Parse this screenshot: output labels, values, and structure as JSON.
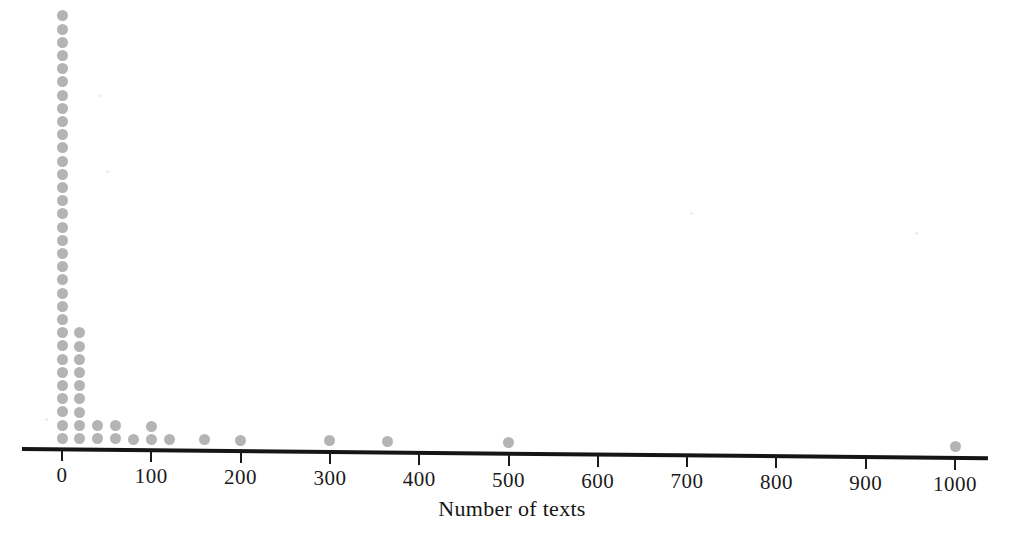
{
  "chart_data": {
    "type": "dotplot",
    "title": "",
    "xlabel": "Number of texts",
    "ylabel": "",
    "xlim": [
      -10,
      1040
    ],
    "xticks": [
      0,
      100,
      200,
      300,
      400,
      500,
      600,
      700,
      800,
      900,
      1000
    ],
    "xticklabels": [
      "0",
      "100",
      "200",
      "300",
      "400",
      "500",
      "600",
      "700",
      "800",
      "900",
      "1000"
    ],
    "grid": false,
    "legend": null,
    "dot_color": "#b4b4b4",
    "axis_color": "#151515",
    "dot_diameter_px": 11,
    "dot_stack_spacing_px": 13.2,
    "x_values": [
      0,
      20,
      40,
      60,
      80,
      100,
      120,
      160,
      200,
      300,
      365,
      500,
      1000
    ],
    "counts": [
      33,
      9,
      2,
      2,
      1,
      2,
      1,
      1,
      1,
      1,
      1,
      1,
      1
    ],
    "stacks": [
      {
        "value": 0,
        "count": 33
      },
      {
        "value": 20,
        "count": 9
      },
      {
        "value": 40,
        "count": 2
      },
      {
        "value": 60,
        "count": 2
      },
      {
        "value": 80,
        "count": 1
      },
      {
        "value": 100,
        "count": 2
      },
      {
        "value": 120,
        "count": 1
      },
      {
        "value": 160,
        "count": 1
      },
      {
        "value": 200,
        "count": 1
      },
      {
        "value": 300,
        "count": 1
      },
      {
        "value": 365,
        "count": 1
      },
      {
        "value": 500,
        "count": 1
      },
      {
        "value": 1000,
        "count": 1
      }
    ],
    "total_observations": 55
  },
  "axis": {
    "label": "Number of texts"
  }
}
